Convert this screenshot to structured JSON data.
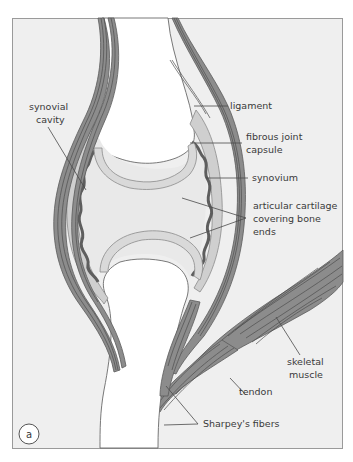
{
  "figure": {
    "panel_label": "a",
    "colors": {
      "background": "#efefef",
      "frame": "#9a9a9a",
      "ligament_band": "#8c8c8c",
      "fiber_line": "#4e4e4e",
      "capsule": "#cfcfcf",
      "synovium": "#5e5e5e",
      "cartilage": "#d9d9d9",
      "bone": "#ffffff",
      "label_text": "#3a3a3a"
    },
    "labels": {
      "synovial_cavity_line1": "synovial",
      "synovial_cavity_line2": "cavity",
      "ligament": "ligament",
      "fibrous_capsule_line1": "fibrous joint",
      "fibrous_capsule_line2": "capsule",
      "synovium": "synovium",
      "cartilage_line1": "articular cartilage",
      "cartilage_line2": "covering bone",
      "cartilage_line3": "ends",
      "skeletal_muscle_line1": "skeletal",
      "skeletal_muscle_line2": "muscle",
      "tendon": "tendon",
      "sharpeys_fibers": "Sharpey's fibers"
    }
  }
}
